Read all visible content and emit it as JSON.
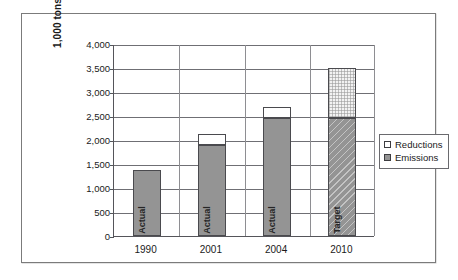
{
  "chart_data": {
    "type": "bar",
    "stacked": true,
    "title": "",
    "subtitle": "",
    "xlabel": "",
    "ylabel": "1,000 tons eCO2",
    "ylabel_parts": {
      "main": "1,000 tons eCO",
      "subscript": "2"
    },
    "categories": [
      "1990",
      "2001",
      "2004",
      "2010"
    ],
    "series": [
      {
        "name": "Emissions",
        "values": [
          1370,
          1900,
          2460,
          2450
        ]
      },
      {
        "name": "Reductions",
        "values": [
          0,
          220,
          230,
          1050
        ]
      }
    ],
    "totals": [
      1370,
      2120,
      2690,
      3500
    ],
    "bar_annotations": [
      "Actual",
      "Actual",
      "Actual",
      "Target"
    ],
    "ylim": [
      0,
      4000
    ],
    "ytick_values": [
      0,
      500,
      1000,
      1500,
      2000,
      2500,
      3000,
      3500,
      4000
    ],
    "ytick_labels": [
      "0",
      "500",
      "1,000",
      "1,500",
      "2,000",
      "2,500",
      "3,000",
      "3,500",
      "4,000"
    ],
    "grid": {
      "horizontal": true,
      "vertical": true
    },
    "legend": {
      "position": "right",
      "entries": [
        {
          "label": "Reductions",
          "swatch": "white-square",
          "color": "#ffffff"
        },
        {
          "label": "Emissions",
          "swatch": "gray-square",
          "color": "#949494"
        }
      ]
    },
    "colors": {
      "emissions": "#949494",
      "reductions": "#ffffff",
      "axis": "#55555a",
      "grid": "#6f6f74",
      "border": "#4a4a4e"
    },
    "patterns": {
      "1990": {
        "emissions": "solid",
        "reductions": "none"
      },
      "2001": {
        "emissions": "solid",
        "reductions": "solid-white"
      },
      "2004": {
        "emissions": "solid",
        "reductions": "solid-white"
      },
      "2010": {
        "emissions": "diagonal-hatch",
        "reductions": "fine-dotted"
      }
    }
  }
}
